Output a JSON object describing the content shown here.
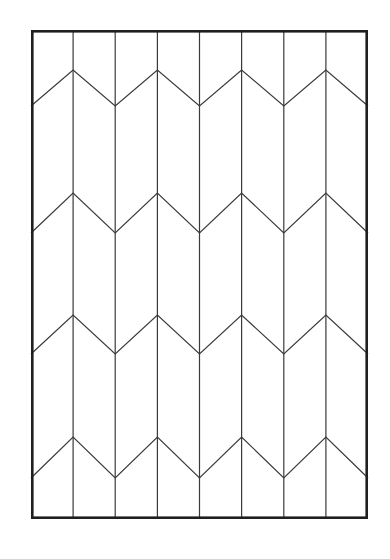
{
  "figure": {
    "canvas_width": 390,
    "canvas_height": 559,
    "background_color": "#ffffff"
  },
  "panel": {
    "name": "outer-panel",
    "x": 31,
    "y": 30,
    "width": 337,
    "height": 489,
    "stroke_color": "#1f1f1f",
    "stroke_width": 2.6,
    "fill_color": "#ffffff"
  },
  "grid": {
    "stroke_color": "#3a3a3a",
    "stroke_width": 1.2,
    "column_count": 8,
    "vertical_line_x": [
      31,
      73.1,
      115.2,
      157.4,
      199.5,
      241.6,
      283.8,
      325.9,
      368
    ]
  },
  "chevrons": {
    "stroke_color": "#3a3a3a",
    "stroke_width": 1.2,
    "row_count": 4,
    "rows": [
      {
        "label": "chevron-row-1",
        "peak_y": 70,
        "valley_y": 106
      },
      {
        "label": "chevron-row-2",
        "peak_y": 193,
        "valley_y": 233
      },
      {
        "label": "chevron-row-3",
        "peak_y": 315,
        "valley_y": 354
      },
      {
        "label": "chevron-row-4",
        "peak_y": 437,
        "valley_y": 478
      }
    ],
    "peak_x": [
      73.1,
      157.4,
      241.6,
      325.9
    ],
    "valley_x": [
      31,
      115.2,
      199.5,
      283.8,
      368
    ]
  }
}
